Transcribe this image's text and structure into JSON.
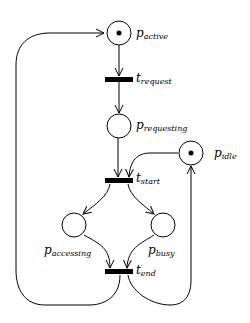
{
  "diagram": {
    "type": "petri-net",
    "colors": {
      "stroke": "#000000",
      "background": "#ffffff"
    },
    "places": [
      {
        "id": "p_active",
        "main": "p",
        "sub": "active",
        "token": true
      },
      {
        "id": "p_requesting",
        "main": "p",
        "sub": "requesting",
        "token": false
      },
      {
        "id": "p_idle",
        "main": "p",
        "sub": "idle",
        "token": true
      },
      {
        "id": "p_accessing",
        "main": "p",
        "sub": "accessing",
        "token": false
      },
      {
        "id": "p_busy",
        "main": "p",
        "sub": "busy",
        "token": false
      }
    ],
    "transitions": [
      {
        "id": "t_request",
        "main": "t",
        "sub": "request"
      },
      {
        "id": "t_start",
        "main": "t",
        "sub": "start"
      },
      {
        "id": "t_end",
        "main": "t",
        "sub": "end"
      }
    ],
    "arcs": [
      {
        "from": "p_active",
        "to": "t_request"
      },
      {
        "from": "t_request",
        "to": "p_requesting"
      },
      {
        "from": "p_requesting",
        "to": "t_start"
      },
      {
        "from": "p_idle",
        "to": "t_start"
      },
      {
        "from": "t_start",
        "to": "p_accessing"
      },
      {
        "from": "t_start",
        "to": "p_busy"
      },
      {
        "from": "p_accessing",
        "to": "t_end"
      },
      {
        "from": "p_busy",
        "to": "t_end"
      },
      {
        "from": "t_end",
        "to": "p_active"
      },
      {
        "from": "t_end",
        "to": "p_idle"
      }
    ]
  }
}
